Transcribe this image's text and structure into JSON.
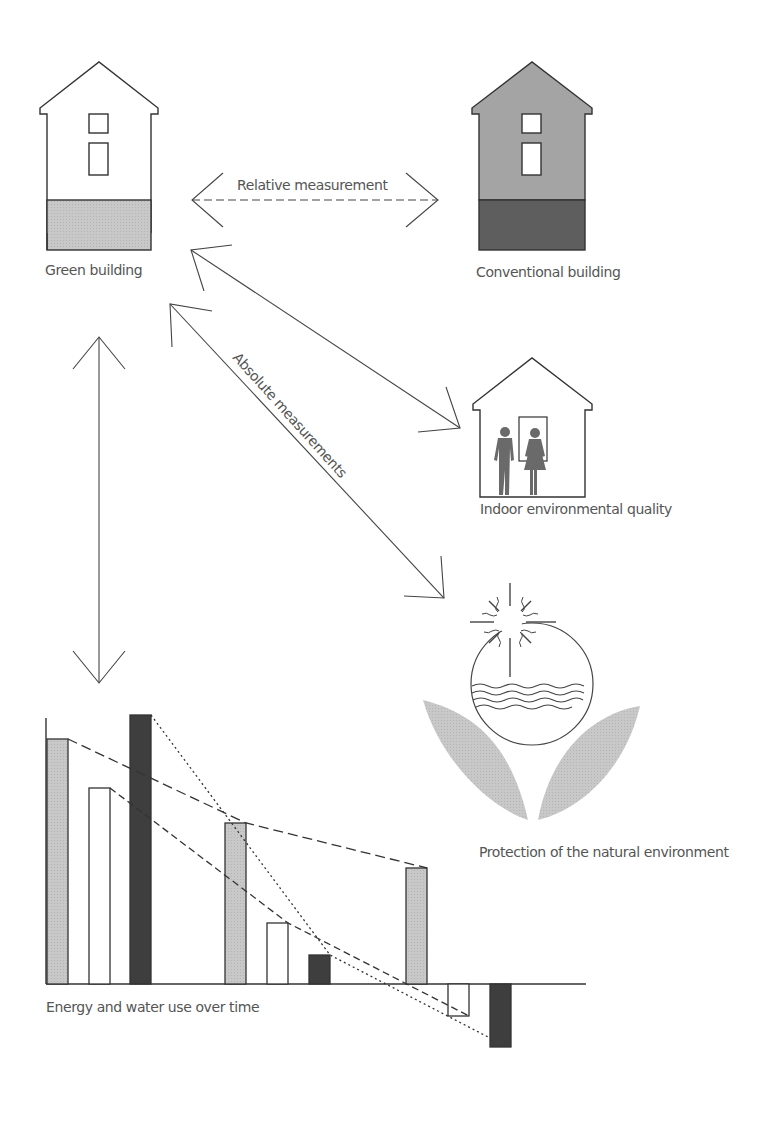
{
  "diagram": {
    "labels": {
      "green_building": "Green building",
      "conventional_building": "Conventional building",
      "relative_measurement": "Relative measurement",
      "absolute_measurements": "Absolute measurements",
      "indoor_quality": "Indoor environmental quality",
      "natural_environment": "Protection of the natural environment",
      "energy_water": "Energy and water use over time"
    },
    "colors": {
      "light_fill": "#c8c8c8",
      "medium_fill": "#9a9a9a",
      "dark_fill": "#5a5a5a",
      "darkest_fill": "#3a3a3a",
      "line": "#333333",
      "text": "#555555"
    },
    "icons": [
      "green-building-house-icon",
      "conventional-building-house-icon",
      "indoor-people-house-icon",
      "sun-water-flower-icon"
    ]
  }
}
